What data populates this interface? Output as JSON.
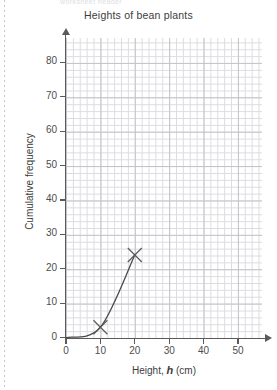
{
  "page": {
    "top_ghost_text": "worksheet header",
    "perforation": "dotted-margin-rule"
  },
  "chart_data": {
    "type": "line",
    "title": "Heights of bean plants",
    "xlabel_prefix": "Height,",
    "xlabel_variable": "h",
    "xlabel_unit": "(cm)",
    "ylabel": "Cumulative frequency",
    "xlim": [
      0,
      56
    ],
    "ylim": [
      0,
      87
    ],
    "xticks": [
      0,
      10,
      20,
      30,
      40,
      50
    ],
    "yticks": [
      0,
      10,
      20,
      30,
      40,
      50,
      60,
      70,
      80
    ],
    "xtick_labels": [
      "0",
      "10",
      "20",
      "30",
      "40",
      "50"
    ],
    "ytick_labels": [
      "0",
      "10",
      "20",
      "30",
      "40",
      "50",
      "60",
      "70",
      "80"
    ],
    "minor_grid_step_x": 2,
    "minor_grid_step_y": 2,
    "grid": true,
    "legend": "none",
    "series": [
      {
        "name": "Cumulative frequency curve",
        "marker": "x",
        "points": [
          {
            "x": 0,
            "y": 0
          },
          {
            "x": 10,
            "y": 3
          },
          {
            "x": 20,
            "y": 24
          }
        ],
        "marked_points": [
          {
            "x": 10,
            "y": 3
          },
          {
            "x": 20,
            "y": 24
          }
        ],
        "color": "#4a4a4a"
      }
    ],
    "colors": {
      "curve": "#4a4a4a",
      "marker": "#5a5a5a",
      "axis": "#5a5a5a",
      "grid_minor": "#dcdce1",
      "grid_major": "#c3c3ca",
      "background": "#ffffff"
    }
  }
}
